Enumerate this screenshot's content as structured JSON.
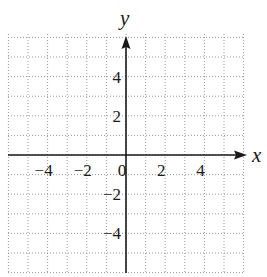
{
  "chart_data": {
    "type": "line",
    "title": "",
    "xlabel": "x",
    "ylabel": "y",
    "xlim": [
      -6,
      6
    ],
    "ylim": [
      -6,
      6
    ],
    "grid": true,
    "grid_style": "dotted",
    "grid_step": 1,
    "x_ticks": [
      -4,
      -2,
      0,
      2,
      4
    ],
    "x_tick_labels": [
      "−4",
      "−2",
      "0",
      "2",
      "4"
    ],
    "y_ticks": [
      4,
      2,
      -2,
      -4
    ],
    "y_tick_labels": [
      "4",
      "2",
      "−2",
      "−4"
    ],
    "series": [],
    "legend": null
  },
  "axes": {
    "x_label": "x",
    "y_label": "y"
  },
  "colors": {
    "axis": "#1a1a1a",
    "grid": "#9a9a9a",
    "background": "#ffffff"
  }
}
